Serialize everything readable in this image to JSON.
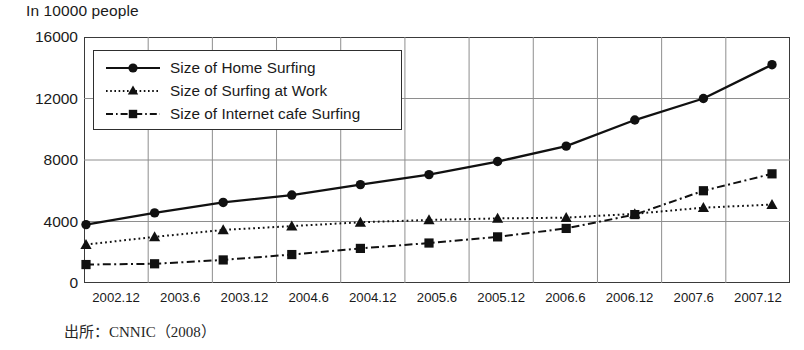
{
  "chart_data": {
    "type": "line",
    "title": "",
    "ylabel": "In 10000 people",
    "xlabel": "",
    "ylim": [
      0,
      16000
    ],
    "yticks": [
      0,
      4000,
      8000,
      12000,
      16000
    ],
    "ytick_labels": [
      "0",
      "4000",
      "8000",
      "12000",
      "16000"
    ],
    "grid": true,
    "legend_position": "upper left",
    "categories": [
      "2002.12",
      "2003.6",
      "2003.12",
      "2004.6",
      "2004.12",
      "2005.6",
      "2005.12",
      "2006.6",
      "2006.12",
      "2007.6",
      "2007.12"
    ],
    "series": [
      {
        "name": "Size of Home Surfing",
        "marker": "circle",
        "linestyle": "solid",
        "color": "#111111",
        "values": [
          3800,
          4560,
          5240,
          5720,
          6400,
          7050,
          7900,
          8900,
          10600,
          12000,
          14200
        ]
      },
      {
        "name": "Size of Surfing at Work",
        "marker": "triangle",
        "linestyle": "dotted",
        "color": "#111111",
        "values": [
          2500,
          3000,
          3450,
          3700,
          3950,
          4100,
          4200,
          4250,
          4500,
          4900,
          5100
        ]
      },
      {
        "name": "Size of Internet cafe Surfing",
        "marker": "square",
        "linestyle": "dashdot",
        "color": "#111111",
        "values": [
          1200,
          1250,
          1500,
          1850,
          2250,
          2600,
          3000,
          3550,
          4450,
          6000,
          7100
        ]
      }
    ],
    "annotations": {
      "source": "出所：CNNIC（2008）"
    }
  },
  "legend": {
    "items": [
      {
        "label": "Size of Home Surfing",
        "icon": "solid-line-circle-marker"
      },
      {
        "label": "Size of Surfing at Work",
        "icon": "dotted-line-triangle-marker"
      },
      {
        "label": "Size of Internet cafe Surfing",
        "icon": "dashdot-line-square-marker"
      }
    ]
  }
}
